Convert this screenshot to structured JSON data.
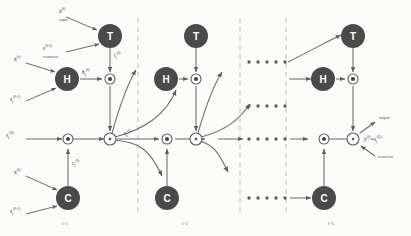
{
  "diagram": {
    "background": "#fbfbfa",
    "node_fill": "#4a4a4a",
    "node_text": "#ffffff",
    "edge_color": "#6b6b6b",
    "dash_color": "#b9b9b9"
  },
  "nodes": {
    "transform": "T",
    "hidden": "H",
    "carry": "C"
  },
  "labels": {
    "input_x": "x",
    "input_x_sup": "(t)",
    "input_caption": "input",
    "recurrent_s": "s",
    "recurrent_s_sub": "t",
    "recurrent_s_sup": "(l-1)",
    "recurrent_caption": "recurrent",
    "x_h": "x",
    "x_h_sup": "(t)",
    "s_h": "s",
    "s_h_sub": "t",
    "s_h_sup": "(l-1)",
    "x_c": "x",
    "x_c_sup": "(t)",
    "s_c": "s",
    "s_c_sub": "t",
    "s_c_sup": "(l-1)",
    "t_gate": "t",
    "t_gate_sub": "t",
    "t_gate_sup": "(l)",
    "h_gate": "h",
    "h_gate_sub": "t",
    "h_gate_sup": "(l)",
    "c_gate": "c",
    "c_gate_sub": "t",
    "c_gate_sup": "(l)",
    "s_in": "s",
    "s_in_sub": "t",
    "s_in_sup": "(0)",
    "s_mid": "s",
    "s_mid_sub": "t",
    "s_mid_sup": "(l)",
    "output_caption": "output",
    "output_recurrent_caption": "recurrent",
    "output_y": "y",
    "output_y_sup": "(t)",
    "output_eq": "=",
    "output_s": "s",
    "output_s_sub": "t",
    "output_s_sup": "(L)"
  },
  "layers": [
    {
      "id": "layer-1",
      "label": "l=1"
    },
    {
      "id": "layer-2",
      "label": "l=2"
    },
    {
      "id": "layer-L",
      "label": "l=L"
    }
  ],
  "ellipsis": {
    "dot_count": 5,
    "rows": [
      "top-gate-row",
      "upper-mid-row",
      "state-row",
      "carry-row"
    ]
  }
}
